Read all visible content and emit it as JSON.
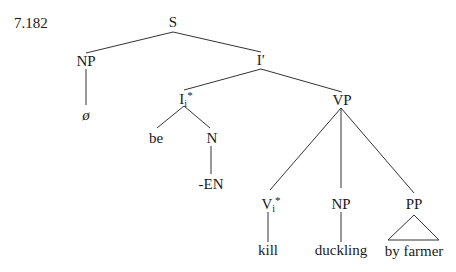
{
  "example_number": "7.182",
  "tree": {
    "S": "S",
    "NP_subject": "NP",
    "null_subject": "ø",
    "I_bar": "I′",
    "I": "I",
    "I_sub": "i",
    "I_sup": "*",
    "be": "be",
    "N": "N",
    "EN": "-EN",
    "VP": "VP",
    "V": "V",
    "V_sub": "i",
    "V_sup": "*",
    "NP_object": "NP",
    "PP": "PP",
    "kill": "kill",
    "duckling": "duckling",
    "by_farmer": "by farmer"
  }
}
